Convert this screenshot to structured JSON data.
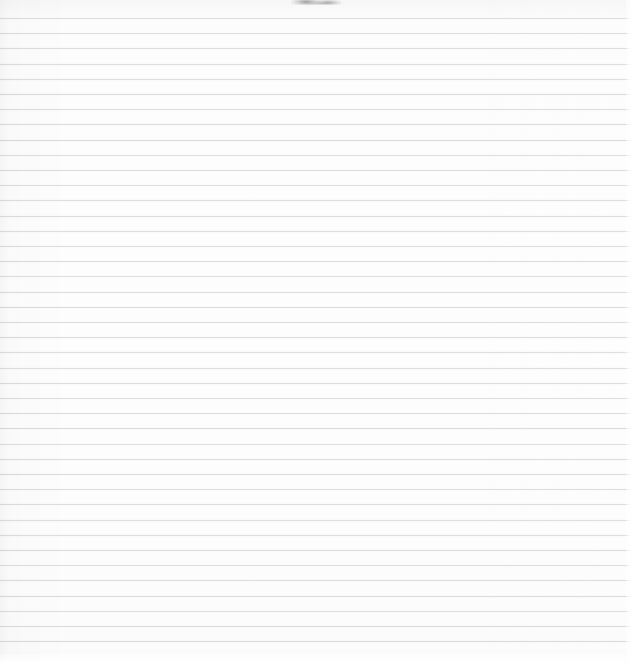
{
  "document": {
    "kind": "scanned-lined-paper",
    "description": "Blank sheet of ruled notebook paper, scanned",
    "content_text": "",
    "width_px": 635,
    "height_px": 666
  },
  "paper": {
    "background_color": "#fdfdfd",
    "edge_highlight_color": "#ffffff",
    "top_margin_px": 18,
    "bottom_margin_px": 16
  },
  "ruling": {
    "line_color": "#dedede",
    "line_thickness_px": 1,
    "line_spacing_px": 15.2,
    "first_line_y_px": 18,
    "last_line_y_px": 650,
    "line_count": 42,
    "full_bleed": true,
    "lines_y": [
      18,
      33.2,
      48.4,
      63.6,
      78.8,
      94,
      109.2,
      124.4,
      139.6,
      154.8,
      170,
      185.2,
      200.4,
      215.6,
      230.8,
      246,
      261.2,
      276.4,
      291.6,
      306.8,
      322,
      337.2,
      352.4,
      367.6,
      382.8,
      398,
      413.2,
      428.4,
      443.6,
      458.8,
      474,
      489.2,
      504.4,
      519.6,
      534.8,
      550,
      565.2,
      580.4,
      595.6,
      610.8,
      626,
      641.2
    ]
  },
  "marks": {
    "top_edge_smudge": {
      "label": "smudge",
      "color": "#5a5a5c",
      "x_px": 291,
      "y_px": 0,
      "width_px": 50,
      "height_px": 6
    }
  }
}
